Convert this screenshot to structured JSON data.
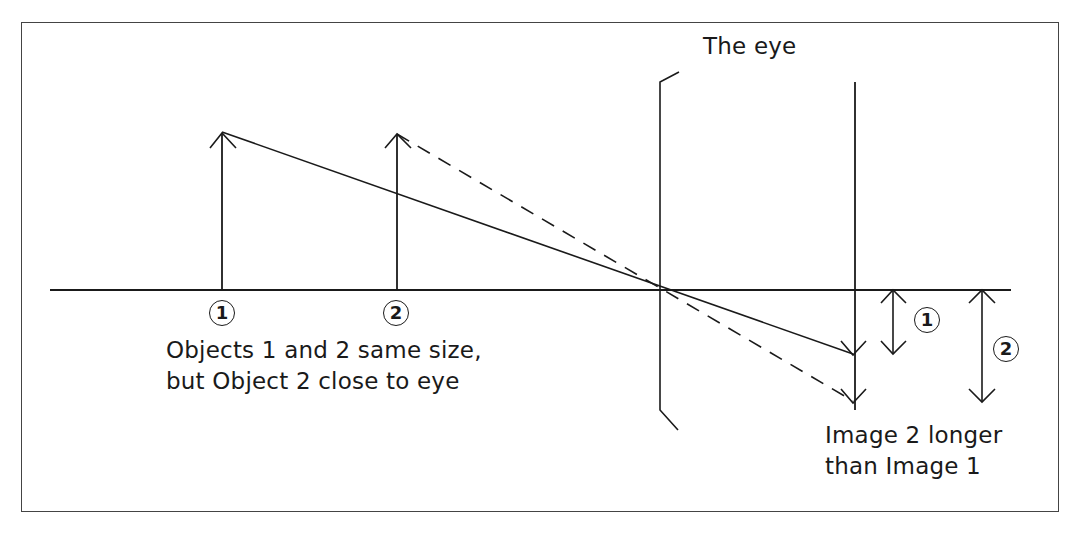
{
  "diagram": {
    "title_label": "The eye",
    "object_markers": [
      {
        "id": "1",
        "label": "1"
      },
      {
        "id": "2",
        "label": "2"
      }
    ],
    "image_markers": [
      {
        "id": "1",
        "label": "1"
      },
      {
        "id": "2",
        "label": "2"
      }
    ],
    "caption_objects": {
      "line1": "Objects 1 and 2 same size,",
      "line2": "but Object 2 close to eye"
    },
    "caption_images": {
      "line1": "Image 2 longer",
      "line2": "than Image 1"
    },
    "elements": {
      "optical_axis": {
        "x1": 50,
        "y1": 290,
        "x2": 1011,
        "y2": 290
      },
      "lens": {
        "x": 660,
        "y_top": 82,
        "y_bottom": 410
      },
      "retina": {
        "x": 855,
        "y_top": 82,
        "y_bottom": 410
      },
      "nodal_point": {
        "x": 660,
        "y": 289
      },
      "object_1": {
        "x": 222,
        "y_base": 290,
        "y_tip": 132
      },
      "object_2": {
        "x": 397,
        "y_base": 290,
        "y_tip": 134
      },
      "image_1": {
        "x": 853,
        "y_tip": 354
      },
      "image_2": {
        "x": 853,
        "y_tip": 401
      },
      "ray_1_style": "solid",
      "ray_2_style": "dashed",
      "size_arrow_1": {
        "x": 893,
        "y_top": 290,
        "y_bottom": 353
      },
      "size_arrow_2": {
        "x": 982,
        "y_top": 290,
        "y_bottom": 402
      }
    },
    "colors": {
      "line": "#1a1a1a",
      "frame": "#444444",
      "background": "#ffffff"
    }
  }
}
